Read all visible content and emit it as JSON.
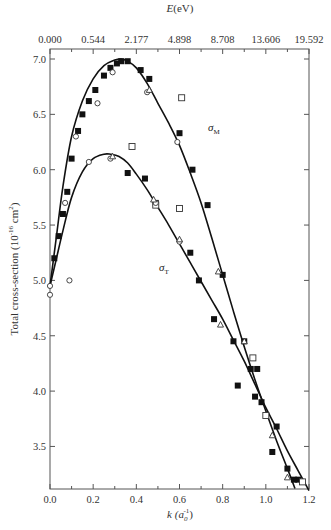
{
  "chart_data": {
    "type": "line",
    "title": "",
    "xlabel": "k (a0^-1)",
    "xlabel_main": "k (a",
    "xlabel_sub": "0",
    "xlabel_sup": "-1",
    "xlabel_close": ")",
    "ylabel": "Total cross-section (10^-16 cm^2)",
    "ylabel_main": "Total cross-section (10",
    "ylabel_sup": "-16",
    "ylabel_unit": " cm",
    "ylabel_sup2": "2",
    "ylabel_close": ")",
    "top_xlabel": "E(eV)",
    "top_xlabel_italic": "E",
    "top_xlabel_rest": "(eV)",
    "xlim": [
      0.0,
      1.2
    ],
    "ylim": [
      3.1,
      7.1
    ],
    "grid": false,
    "x_ticks": [
      "0.0",
      "0.2",
      "0.4",
      "0.6",
      "0.8",
      "1.0",
      "1.2"
    ],
    "x_tick_values": [
      0.0,
      0.2,
      0.4,
      0.6,
      0.8,
      1.0,
      1.2
    ],
    "top_ticks": [
      "0.000",
      "0.544",
      "2.177",
      "4.898",
      "8.708",
      "13.606",
      "19.592"
    ],
    "y_ticks": [
      "3.5",
      "4.0",
      "4.5",
      "5.0",
      "5.5",
      "6.0",
      "6.5",
      "7.0"
    ],
    "y_tick_values": [
      3.5,
      4.0,
      4.5,
      5.0,
      5.5,
      6.0,
      6.5,
      7.0
    ],
    "series": [
      {
        "name": "σM",
        "label_main": "σ",
        "label_sub": "M",
        "curve_x": [
          0.0,
          0.03,
          0.06,
          0.1,
          0.15,
          0.2,
          0.25,
          0.3,
          0.33,
          0.36,
          0.4,
          0.45,
          0.5,
          0.55,
          0.6,
          0.65,
          0.7,
          0.75,
          0.8,
          0.85,
          0.9,
          0.95,
          1.0,
          1.05,
          1.1,
          1.135
        ],
        "curve_y": [
          4.95,
          5.4,
          5.85,
          6.3,
          6.62,
          6.82,
          6.94,
          6.99,
          7.0,
          6.98,
          6.92,
          6.78,
          6.6,
          6.42,
          6.22,
          5.97,
          5.7,
          5.38,
          5.05,
          4.72,
          4.4,
          4.1,
          3.82,
          3.55,
          3.3,
          3.12
        ],
        "points_filled": [
          [
            0.02,
            5.2
          ],
          [
            0.04,
            5.4
          ],
          [
            0.06,
            5.6
          ],
          [
            0.08,
            5.8
          ],
          [
            0.1,
            6.1
          ],
          [
            0.13,
            6.35
          ],
          [
            0.15,
            6.5
          ],
          [
            0.18,
            6.62
          ],
          [
            0.21,
            6.72
          ],
          [
            0.25,
            6.85
          ],
          [
            0.28,
            6.92
          ],
          [
            0.31,
            6.96
          ],
          [
            0.33,
            6.98
          ],
          [
            0.36,
            6.98
          ],
          [
            0.42,
            6.9
          ],
          [
            0.46,
            6.82
          ],
          [
            0.6,
            6.33
          ],
          [
            0.66,
            6.0
          ],
          [
            0.73,
            5.68
          ],
          [
            0.8,
            5.05
          ],
          [
            0.9,
            4.45
          ],
          [
            0.87,
            4.05
          ],
          [
            0.95,
            3.95
          ],
          [
            1.05,
            3.68
          ],
          [
            1.1,
            3.3
          ],
          [
            1.15,
            3.2
          ]
        ],
        "points_open_circle": [
          [
            0.07,
            5.7
          ],
          [
            0.12,
            6.3
          ],
          [
            0.22,
            6.6
          ],
          [
            0.29,
            6.88
          ],
          [
            0.45,
            6.7
          ],
          [
            0.59,
            6.25
          ]
        ],
        "points_triangle": [
          [
            0.46,
            6.72
          ],
          [
            0.78,
            5.08
          ],
          [
            0.9,
            4.45
          ],
          [
            1.03,
            3.6
          ]
        ],
        "points_open_square": [
          [
            0.61,
            6.65
          ],
          [
            0.94,
            4.3
          ]
        ]
      },
      {
        "name": "σT",
        "label_main": "σ",
        "label_sub": "T",
        "curve_x": [
          0.0,
          0.03,
          0.06,
          0.1,
          0.15,
          0.2,
          0.25,
          0.28,
          0.32,
          0.36,
          0.4,
          0.45,
          0.5,
          0.55,
          0.6,
          0.65,
          0.7,
          0.75,
          0.8,
          0.85,
          0.9,
          0.95,
          1.0,
          1.05,
          1.1,
          1.15,
          1.2
        ],
        "curve_y": [
          4.95,
          5.2,
          5.45,
          5.75,
          5.98,
          6.1,
          6.14,
          6.14,
          6.12,
          6.06,
          5.96,
          5.82,
          5.66,
          5.5,
          5.33,
          5.16,
          4.99,
          4.82,
          4.65,
          4.46,
          4.27,
          4.06,
          3.85,
          3.66,
          3.46,
          3.28,
          3.1
        ],
        "points_filled": [
          [
            0.36,
            5.97
          ],
          [
            0.44,
            5.92
          ],
          [
            0.49,
            5.7
          ],
          [
            0.65,
            5.25
          ],
          [
            0.69,
            5.0
          ],
          [
            0.76,
            4.65
          ],
          [
            0.85,
            4.45
          ],
          [
            0.93,
            4.2
          ],
          [
            0.96,
            4.2
          ],
          [
            0.98,
            3.9
          ],
          [
            1.03,
            3.45
          ],
          [
            1.13,
            3.2
          ]
        ],
        "points_open_circle": [
          [
            0.0,
            4.87
          ],
          [
            0.0,
            4.95
          ],
          [
            0.09,
            5.0
          ],
          [
            0.18,
            6.07
          ],
          [
            0.28,
            6.1
          ],
          [
            0.49,
            5.7
          ],
          [
            0.6,
            5.35
          ]
        ],
        "points_triangle": [
          [
            0.29,
            6.12
          ],
          [
            0.48,
            5.73
          ],
          [
            0.6,
            5.37
          ],
          [
            0.79,
            4.6
          ],
          [
            1.1,
            3.22
          ]
        ],
        "points_open_square": [
          [
            0.38,
            6.21
          ],
          [
            0.6,
            5.65
          ],
          [
            0.49,
            5.68
          ],
          [
            1.0,
            3.78
          ],
          [
            1.17,
            3.18
          ]
        ]
      }
    ],
    "annotations": [
      {
        "text": "σM",
        "x": 0.73,
        "y": 6.27
      },
      {
        "text": "σT",
        "x": 0.42,
        "y": 5.47
      }
    ]
  }
}
